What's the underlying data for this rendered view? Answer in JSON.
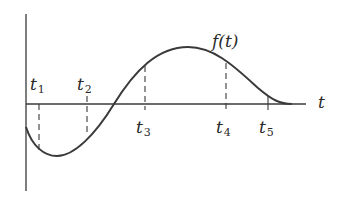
{
  "diagram": {
    "curve_label": "f(t)",
    "axis_label": "t",
    "colors": {
      "ink": "#3a3a3a",
      "background": "#ffffff"
    },
    "markers": [
      {
        "name": "t",
        "sub": "1",
        "x": 39,
        "position": "above"
      },
      {
        "name": "t",
        "sub": "2",
        "x": 87,
        "position": "above"
      },
      {
        "name": "t",
        "sub": "3",
        "x": 145,
        "position": "below"
      },
      {
        "name": "t",
        "sub": "4",
        "x": 226,
        "position": "below"
      },
      {
        "name": "t",
        "sub": "5",
        "x": 268,
        "position": "below"
      }
    ]
  }
}
